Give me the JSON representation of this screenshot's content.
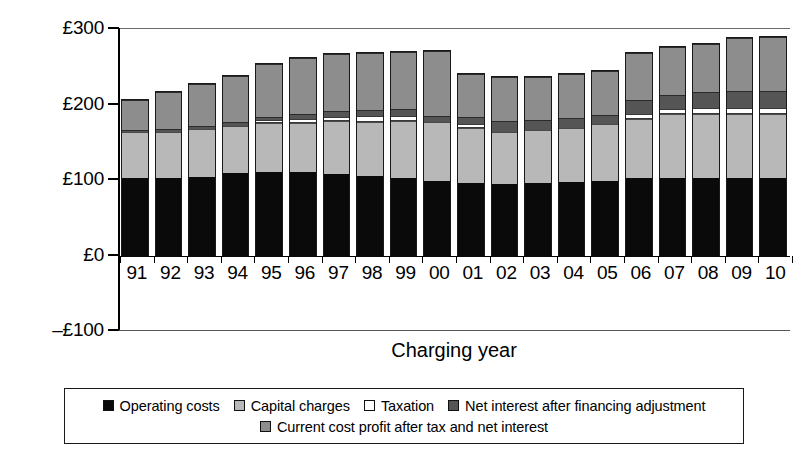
{
  "chart_data": {
    "type": "bar",
    "subtype": "stacked-bar",
    "title": "",
    "xlabel": "Charging year",
    "ylabel": "",
    "ylim": [
      -100,
      300
    ],
    "yticks": [
      -100,
      0,
      100,
      200,
      300
    ],
    "ytick_labels": [
      "–£100",
      "£0",
      "£100",
      "£200",
      "£300"
    ],
    "currency": "GBP",
    "grid": false,
    "legend_position": "bottom",
    "categories": [
      "91",
      "92",
      "93",
      "94",
      "95",
      "96",
      "97",
      "98",
      "99",
      "00",
      "01",
      "02",
      "03",
      "04",
      "05",
      "06",
      "07",
      "08",
      "09",
      "10"
    ],
    "series": [
      {
        "name": "Operating costs",
        "color": "#0a0a0a",
        "values": [
          105,
          104,
          106,
          111,
          113,
          113,
          110,
          107,
          105,
          101,
          98,
          97,
          98,
          99,
          101,
          105,
          105,
          105,
          104,
          104
        ]
      },
      {
        "name": "Capital charges",
        "color": "#b8b8b8",
        "values": [
          61,
          62,
          64,
          63,
          64,
          65,
          70,
          72,
          75,
          78,
          73,
          68,
          70,
          72,
          75,
          78,
          84,
          84,
          86,
          86
        ]
      },
      {
        "name": "Taxation",
        "color": "#ffffff",
        "values": [
          0,
          0,
          0,
          0,
          4,
          5,
          6,
          8,
          7,
          0,
          5,
          0,
          0,
          0,
          0,
          7,
          7,
          8,
          8,
          8
        ]
      },
      {
        "name": "Net interest after financing adjustment",
        "color": "#555555",
        "values": [
          2,
          3,
          4,
          5,
          5,
          6,
          7,
          8,
          9,
          8,
          9,
          15,
          14,
          13,
          12,
          18,
          19,
          21,
          22,
          22
        ]
      },
      {
        "name": "Current cost profit after tax and net interest",
        "color": "#8d8d8d",
        "values": [
          40,
          49,
          55,
          61,
          69,
          74,
          76,
          75,
          76,
          86,
          57,
          58,
          56,
          58,
          59,
          62,
          63,
          64,
          70,
          72
        ]
      }
    ],
    "totals": [
      208,
      218,
      229,
      240,
      255,
      263,
      269,
      270,
      272,
      273,
      242,
      238,
      238,
      242,
      247,
      270,
      278,
      282,
      290,
      292
    ]
  },
  "axis": {
    "x_title": "Charging year"
  },
  "legend": {
    "row1": [
      {
        "label": "Operating costs",
        "swatch": "sw-op"
      },
      {
        "label": "Capital charges",
        "swatch": "sw-cap"
      },
      {
        "label": "Taxation",
        "swatch": "sw-tax"
      },
      {
        "label": "Net interest after financing adjustment",
        "swatch": "sw-net"
      }
    ],
    "row2": [
      {
        "label": "Current cost profit after tax and net interest",
        "swatch": "sw-prof"
      }
    ]
  }
}
